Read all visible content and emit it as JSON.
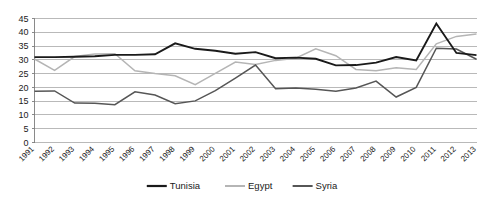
{
  "chart_data": {
    "type": "line",
    "title": "",
    "subtitle": "",
    "xlabel": "",
    "ylabel": "",
    "ylim": [
      0,
      45
    ],
    "yticks": [
      0,
      5,
      10,
      15,
      20,
      25,
      30,
      35,
      40,
      45
    ],
    "grid": true,
    "legend_position": "bottom",
    "categories": [
      "1991",
      "1992",
      "1993",
      "1994",
      "1995",
      "1996",
      "1997",
      "1998",
      "1999",
      "2000",
      "2001",
      "2002",
      "2003",
      "2004",
      "2005",
      "2006",
      "2007",
      "2008",
      "2009",
      "2010",
      "2011",
      "2012",
      "2013"
    ],
    "series": [
      {
        "name": "Tunisia",
        "color": "#1a1a1a",
        "values": [
          31.0,
          31.0,
          31.1,
          31.3,
          31.8,
          31.8,
          32.0,
          36.0,
          34.0,
          33.3,
          32.2,
          32.8,
          30.6,
          30.8,
          30.4,
          28.0,
          28.1,
          29.0,
          31.0,
          29.8,
          43.2,
          32.5,
          31.7
        ]
      },
      {
        "name": "Egypt",
        "color": "#b5b5b5",
        "values": [
          30.3,
          26.2,
          31.2,
          32.1,
          32.2,
          26.0,
          25.0,
          24.2,
          21.0,
          25.1,
          29.2,
          28.3,
          29.8,
          30.6,
          34.0,
          31.5,
          26.5,
          26.0,
          27.1,
          26.5,
          35.8,
          38.5,
          39.4
        ]
      },
      {
        "name": "Syria",
        "color": "#565656",
        "values": [
          18.6,
          18.7,
          14.3,
          14.2,
          13.7,
          18.4,
          17.2,
          14.1,
          15.1,
          18.8,
          23.4,
          28.1,
          19.5,
          19.8,
          19.3,
          18.6,
          19.8,
          22.3,
          16.5,
          20.0,
          34.2,
          33.9,
          30.2
        ]
      }
    ]
  },
  "legend": {
    "items": [
      {
        "label": "Tunisia",
        "color": "#1a1a1a"
      },
      {
        "label": "Egypt",
        "color": "#b5b5b5"
      },
      {
        "label": "Syria",
        "color": "#565656"
      }
    ]
  }
}
